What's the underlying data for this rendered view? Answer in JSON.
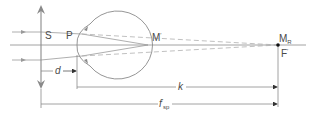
{
  "diagram": {
    "type": "optics-schematic",
    "labels": {
      "S": "S",
      "P": "P",
      "M_prime_base": "M",
      "M_prime_mark": "′",
      "M_R_base": "M",
      "M_R_sub": "R",
      "F_prime_base": "F",
      "F_prime_mark": "′",
      "d": "d",
      "k": "k",
      "f_sp_base": "f",
      "f_sp_mark": "′",
      "f_sp_sub": "sp"
    },
    "elements": {
      "lens": "double-headed vertical arrow at S",
      "optical_axis": "horizontal line through eye",
      "eye": "circular eyeball with corneal bulge at P",
      "incident_rays": 2,
      "dashed_rays_to": "M_R / F'",
      "dimension_lines": [
        "d (S to P)",
        "k (P to M_R)",
        "f'sp (S to F')"
      ]
    },
    "colors": {
      "line": "#8a8a8a",
      "text": "#4a4a4a",
      "dashed": "#b0b0b0",
      "point": "#111111",
      "background": "#ffffff"
    }
  }
}
